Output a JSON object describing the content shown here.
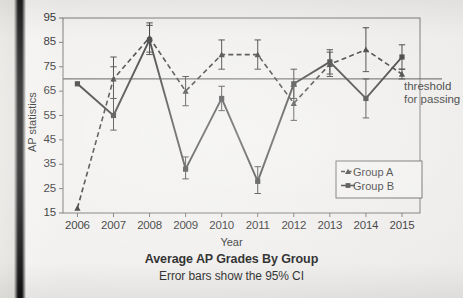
{
  "chart_data": {
    "type": "line",
    "title": "Average AP Grades By Group",
    "subtitle": "Error bars show the 95% CI",
    "xlabel": "Year",
    "ylabel": "AP statistics",
    "xlim": [
      2005.6,
      2015.5
    ],
    "ylim": [
      15,
      95
    ],
    "yticks": [
      15,
      25,
      35,
      45,
      55,
      65,
      75,
      85,
      95
    ],
    "ytick_labels": [
      "15",
      "25",
      "35",
      "45",
      "55",
      "65",
      "75",
      "85",
      "95"
    ],
    "categories": [
      2006,
      2007,
      2008,
      2009,
      2010,
      2011,
      2012,
      2013,
      2014,
      2015
    ],
    "xtick_labels": [
      "2006",
      "2007",
      "2008",
      "2009",
      "2010",
      "2011",
      "2012",
      "2013",
      "2014",
      "2015"
    ],
    "grid": false,
    "legend_position": "lower right",
    "series": [
      {
        "name": "Group A",
        "style": "dashed",
        "marker": "triangle",
        "values": [
          17,
          70,
          87,
          65,
          80,
          80,
          60,
          76,
          82,
          72
        ],
        "err_low": [
          17,
          62,
          81,
          59,
          74,
          74,
          53,
          71,
          73,
          70
        ],
        "err_high": [
          17,
          79,
          93,
          71,
          86,
          86,
          67,
          81,
          91,
          74
        ]
      },
      {
        "name": "Group B",
        "style": "solid",
        "marker": "square",
        "values": [
          68,
          55,
          86,
          33,
          62,
          28,
          68,
          77,
          62,
          79
        ],
        "err_low": [
          68,
          49,
          80,
          29,
          57,
          23,
          62,
          72,
          54,
          74
        ],
        "err_high": [
          68,
          75,
          92,
          38,
          67,
          34,
          74,
          82,
          70,
          84
        ]
      }
    ],
    "reference_lines": [
      {
        "name": "threshold for passing",
        "y": 70,
        "label": "threshold\nfor passing",
        "label_line_1": "threshold",
        "label_line_2": "for passing"
      }
    ]
  },
  "legend": {
    "entries": [
      {
        "label": "Group A"
      },
      {
        "label": "Group B"
      }
    ]
  },
  "annotations": {
    "threshold_line_1": "threshold",
    "threshold_line_2": "for passing"
  },
  "colors": {
    "ink": "#1b1b1b",
    "line": "#262626",
    "reference": "#5a5a5a",
    "axis": "#6b6b6b",
    "page": "#efeeec"
  }
}
